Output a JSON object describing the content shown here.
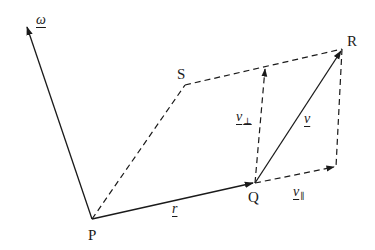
{
  "diagram": {
    "points": {
      "P": {
        "label": "P",
        "x": 92,
        "y": 219
      },
      "Q": {
        "label": "Q",
        "x": 255,
        "y": 183
      },
      "R": {
        "label": "R",
        "x": 342,
        "y": 49
      },
      "S": {
        "label": "S",
        "x": 185,
        "y": 85
      },
      "corner": {
        "x": 336,
        "y": 167
      },
      "omega_tip": {
        "x": 26,
        "y": 25
      },
      "vperp_tip": {
        "x": 265,
        "y": 67
      }
    },
    "vectors": {
      "omega": {
        "symbol": "ω",
        "style": "solid-arrow"
      },
      "r": {
        "symbol": "r",
        "style": "solid-arrow"
      },
      "v": {
        "symbol": "v",
        "style": "solid-arrow"
      },
      "v_perp": {
        "symbol": "v",
        "subscript": "⊥",
        "style": "dashed-arrow"
      },
      "v_parallel": {
        "symbol": "v",
        "subscript": "∥",
        "style": "dashed-arrow"
      }
    },
    "colors": {
      "stroke": "#1a1a1a",
      "background": "#ffffff"
    }
  }
}
